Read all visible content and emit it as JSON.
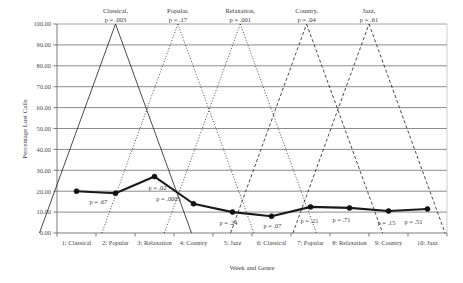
{
  "chart_data": {
    "type": "line",
    "title": "",
    "xlabel": "Week and Genre",
    "ylabel": "Percentage Lost Calls",
    "ylim": [
      0,
      100
    ],
    "ytick_step": 10,
    "ytick_labels": [
      "0.00",
      "10.00",
      "20.00",
      "30.00",
      "40.00",
      "50.00",
      "60.00",
      "70.00",
      "80.00",
      "90.00",
      "100.00"
    ],
    "ytick_values": [
      0,
      10,
      20,
      30,
      40,
      50,
      60,
      70,
      80,
      90,
      100
    ],
    "grid": true,
    "legend": "none",
    "categories": [
      "1: Classical",
      "2: Popular",
      "3: Relaxation",
      "4: Country",
      "5: Jazz",
      "6: Classical",
      "7: Popular",
      "8: Relaxation",
      "9: Country",
      "10: Jazz"
    ],
    "x": [
      1,
      2,
      3,
      4,
      5,
      6,
      7,
      8,
      9,
      10
    ],
    "series": [
      {
        "name": "Percentage Lost Calls",
        "style": "solid-thick-markers",
        "values": [
          20.0,
          19.0,
          27.0,
          14.0,
          10.0,
          8.0,
          12.5,
          12.0,
          10.5,
          11.5
        ]
      }
    ],
    "point_annotations": [
      {
        "index": 1,
        "label": "p = .67"
      },
      {
        "index": 2,
        "label": "p = .02"
      },
      {
        "index": 2,
        "label": "p = .0005"
      },
      {
        "index": 4,
        "label": "p = .24"
      },
      {
        "index": 5,
        "label": "p = .07"
      },
      {
        "index": 6,
        "label": "p = .21"
      },
      {
        "index": 7,
        "label": "p = .71"
      },
      {
        "index": 8,
        "label": "p = .15"
      },
      {
        "index": 9,
        "label": "p = .51"
      }
    ],
    "genre_markers": [
      {
        "name": "Classical,",
        "p": "p = .003",
        "apex_x": 2.0,
        "style": "solid"
      },
      {
        "name": "Popular,",
        "p": "p = .17",
        "apex_x": 3.6,
        "style": "dotted"
      },
      {
        "name": "Relaxation,",
        "p": "p = .001",
        "apex_x": 5.2,
        "style": "dotted"
      },
      {
        "name": "Country,",
        "p": "p = .04",
        "apex_x": 6.9,
        "style": "dashed"
      },
      {
        "name": "Jazz,",
        "p": "p = .61",
        "apex_x": 8.5,
        "style": "dashed"
      }
    ]
  },
  "axis": {
    "y_title": "Percentage Lost Calls",
    "x_title": "Week and Genre"
  },
  "annotations": {
    "top": [
      {
        "genre": "Classical,",
        "p": "p = .003"
      },
      {
        "genre": "Popular,",
        "p": "p = .17"
      },
      {
        "genre": "Relaxation,",
        "p": "p = .001"
      },
      {
        "genre": "Country,",
        "p": "p = .04"
      },
      {
        "genre": "Jazz,",
        "p": "p = .61"
      }
    ],
    "inline": [
      "p = .67",
      "p = .02",
      "p = .0005",
      "p = .24",
      "p = .07",
      "p = .21",
      "p = .71",
      "p = .15",
      "p = .51"
    ]
  },
  "colors": {
    "line": "#1a1a1a",
    "grid": "#8c8c8c",
    "axis": "#6e6e6e",
    "text": "#3a3a3a",
    "background": "#ffffff"
  }
}
